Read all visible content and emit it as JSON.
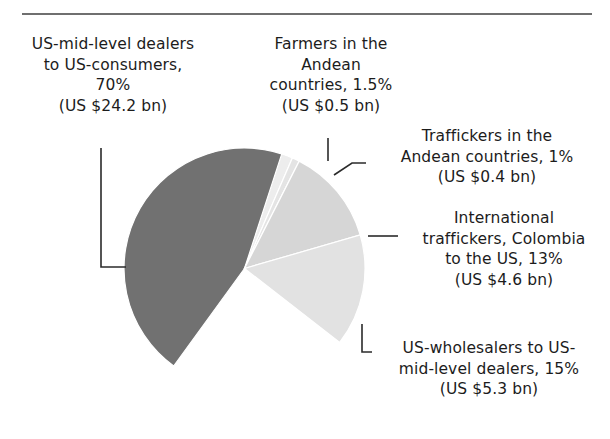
{
  "chart_data": {
    "type": "pie",
    "title": "",
    "subtitle": "",
    "xlabel": "",
    "ylabel": "",
    "legend_position": "none",
    "grid": false,
    "units": "US$ billions",
    "total_label": "",
    "categories": [
      "US-mid-level dealers to US-consumers",
      "Farmers in the Andean countries",
      "Traffickers in the Andean countries",
      "International traffickers, Colombia to the US",
      "US-wholesalers to US-mid-level dealers"
    ],
    "values": [
      70,
      1.5,
      1,
      13,
      15
    ],
    "value_amounts": [
      24.2,
      0.5,
      0.4,
      4.6,
      5.3
    ],
    "slices": [
      {
        "name": "US-mid-level dealers to US-consumers",
        "percent": 70,
        "percent_label": "70%",
        "amount": 24.2,
        "amount_label": "(US $24.2 bn)",
        "color": "#717171",
        "start_angle": 126,
        "sweep": 252
      },
      {
        "name": "Farmers in the Andean countries",
        "percent": 1.5,
        "percent_label": "1.5%",
        "amount": 0.5,
        "amount_label": "(US $0.5 bn)",
        "color": "#ededed",
        "start_angle": -72,
        "sweep": 5.4
      },
      {
        "name": "Traffickers in the Andean countries",
        "percent": 1,
        "percent_label": "1%",
        "amount": 0.4,
        "amount_label": "(US $0.4 bn)",
        "color": "#e4e4e4",
        "start_angle": -66.6,
        "sweep": 3.6
      },
      {
        "name": "International traffickers, Colombia to the US",
        "percent": 13,
        "percent_label": "13%",
        "amount": 4.6,
        "amount_label": "(US $4.6 bn)",
        "color": "#d6d6d6",
        "start_angle": -63,
        "sweep": 46.8
      },
      {
        "name": "US-wholesalers to US-mid-level dealers",
        "percent": 15,
        "percent_label": "15%",
        "amount": 5.3,
        "amount_label": "(US $5.3 bn)",
        "color": "#e2e2e2",
        "start_angle": -16.2,
        "sweep": 54
      }
    ]
  },
  "labels": {
    "consumers": "US-mid-level dealers\nto US-consumers,\n70%\n(US $24.2 bn)",
    "farmers": "Farmers in the\nAndean\ncountries, 1.5%\n(US $0.5 bn)",
    "traffickers_andean": "Traffickers in the\nAndean countries, 1%\n(US $0.4 bn)",
    "international": "International\ntraffickers, Colombia\nto the US, 13%\n(US $4.6 bn)",
    "wholesalers": "US-wholesalers to US-\nmid-level dealers, 15%\n(US $5.3 bn)"
  },
  "colors": {
    "slice_dark": "#717171",
    "slice_light_13": "#d6d6d6",
    "slice_light_15": "#e2e2e2",
    "slice_sliver_farmers": "#ededed",
    "slice_sliver_traffickers": "#e4e4e4",
    "leader_line": "#2b2b2b",
    "rule": "#6f6f6f",
    "background": "#ffffff",
    "text": "#1c1c1c"
  }
}
